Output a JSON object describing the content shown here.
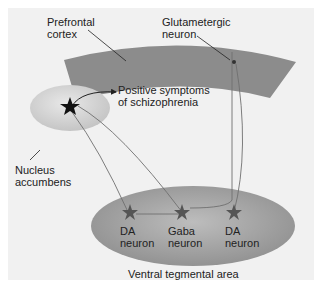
{
  "labels": {
    "prefrontal_cortex": "Prefrontal\ncortex",
    "glutamatergic_neuron": "Glutametergic\nneuron",
    "positive_symptoms": "Positive symptoms\nof schizophrenia",
    "nucleus_accumbens": "Nucleus\naccumbens",
    "da_neuron_left": "DA\nneuron",
    "gaba_neuron": "Gaba\nneuron",
    "da_neuron_right": "DA\nneuron",
    "ventral_tegmental_area": "Ventral tegmental area"
  },
  "colors": {
    "cortex_band": "#8c8c8c",
    "vta_ellipse": "#9a9a9a",
    "nac_ellipse": "#cfcfcf",
    "neuron_star": "#5a5a5a",
    "nac_star": "#111111",
    "pathway_line": "#666666"
  }
}
